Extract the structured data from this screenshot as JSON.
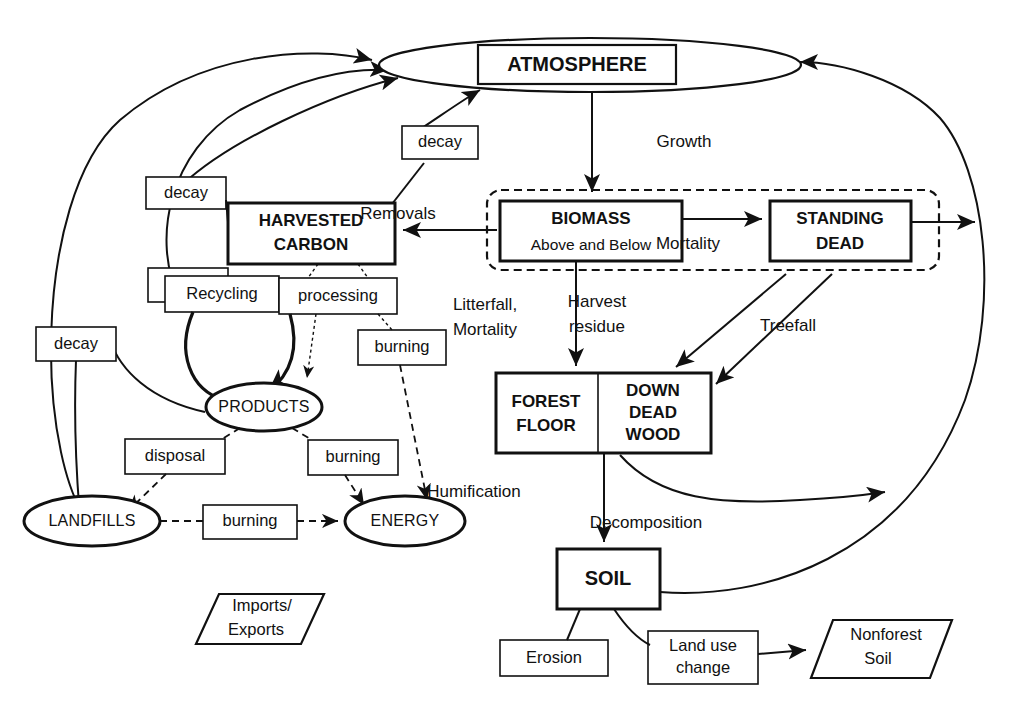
{
  "diagram": {
    "type": "flow-diagram",
    "colors": {
      "stroke": "#111111",
      "fill": "#ffffff",
      "text": "#111111"
    },
    "pools": {
      "atmosphere": {
        "label": "ATMOSPHERE",
        "shape": "rect-in-ellipse"
      },
      "harvested_carbon": {
        "line1": "HARVESTED",
        "line2": "CARBON",
        "shape": "rect"
      },
      "biomass": {
        "label": "BIOMASS",
        "sub": "Above and Below",
        "shape": "rect"
      },
      "standing_dead": {
        "line1": "STANDING",
        "line2": "DEAD",
        "shape": "rect"
      },
      "forest_floor": {
        "line1": "FOREST",
        "line2": "FLOOR",
        "shape": "rect"
      },
      "down_dead_wood": {
        "line1": "DOWN",
        "line2": "DEAD",
        "line3": "WOOD",
        "shape": "rect"
      },
      "soil": {
        "label": "SOIL",
        "shape": "rect"
      },
      "products": {
        "label": "PRODUCTS",
        "shape": "ellipse"
      },
      "landfills": {
        "label": "LANDFILLS",
        "shape": "ellipse"
      },
      "energy": {
        "label": "ENERGY",
        "shape": "ellipse"
      },
      "imports_exports": {
        "line1": "Imports/",
        "line2": "Exports",
        "shape": "parallelogram"
      },
      "nonforest_soil": {
        "line1": "Nonforest",
        "line2": "Soil",
        "shape": "parallelogram"
      }
    },
    "process_boxes": [
      {
        "id": "decay-products",
        "label": "decay"
      },
      {
        "id": "decay-harvested",
        "label": "decay"
      },
      {
        "id": "decay-landfills",
        "label": "decay"
      },
      {
        "id": "recycling",
        "label": "Recycling"
      },
      {
        "id": "processing",
        "label": "processing"
      },
      {
        "id": "burning-processing",
        "label": "burning"
      },
      {
        "id": "disposal",
        "label": "disposal"
      },
      {
        "id": "burning-products",
        "label": "burning"
      },
      {
        "id": "burning-landfills",
        "label": "burning"
      },
      {
        "id": "erosion",
        "label": "Erosion"
      },
      {
        "id": "land-use-change",
        "line1": "Land use",
        "line2": "change"
      }
    ],
    "flow_labels": [
      {
        "id": "growth",
        "label": "Growth"
      },
      {
        "id": "removals",
        "label": "Removals"
      },
      {
        "id": "mortality",
        "label": "Mortality"
      },
      {
        "id": "treefall",
        "label": "Treefall"
      },
      {
        "id": "litterfall",
        "line1": "Litterfall,",
        "line2": "Mortality"
      },
      {
        "id": "harvest",
        "line1": "Harvest",
        "line2": "residue"
      },
      {
        "id": "humification",
        "label": "Humification"
      },
      {
        "id": "decomposition",
        "label": "Decomposition"
      }
    ]
  }
}
